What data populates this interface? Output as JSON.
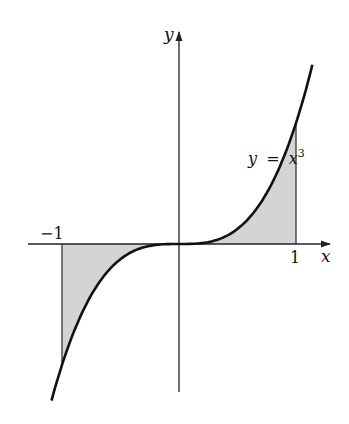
{
  "figure": {
    "function_label": "y = x³",
    "function_label_parts": {
      "lhs": "y",
      "eq": "=",
      "base": "x",
      "exp": "3"
    },
    "x_axis_label": "x",
    "y_axis_label": "y",
    "tick_left": "−1",
    "tick_right": "1",
    "colors": {
      "curve": "#111111",
      "axis": "#222222",
      "shade": "#d4d4d4"
    }
  },
  "chart_data": {
    "type": "line",
    "title": "",
    "function": "y = x^3",
    "xlabel": "x",
    "ylabel": "y",
    "x_range_drawn": [
      -1.09,
      1.14
    ],
    "shaded_region": {
      "from_x": -1,
      "to_x": 1,
      "between": "curve and x-axis"
    },
    "ticks": {
      "x": [
        -1,
        1
      ]
    },
    "grid": false,
    "legend": "none"
  }
}
